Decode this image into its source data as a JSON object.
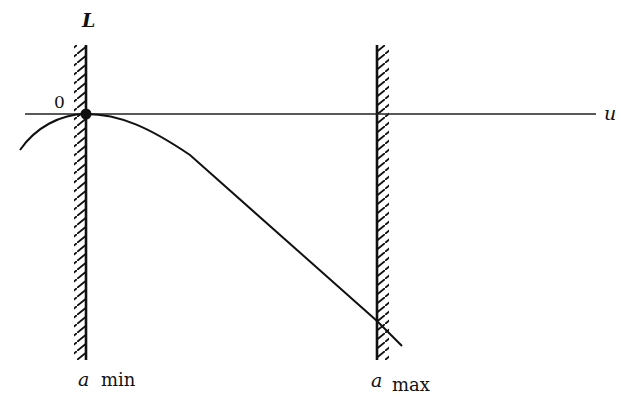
{
  "figure": {
    "y_axis_label": "L",
    "x_axis_label": "u",
    "origin_label": "0",
    "left_boundary": {
      "symbol": "a",
      "subscript": "min"
    },
    "right_boundary": {
      "symbol": "a",
      "subscript": "max"
    }
  },
  "colors": {
    "ink": "#111111",
    "background": "#ffffff"
  }
}
